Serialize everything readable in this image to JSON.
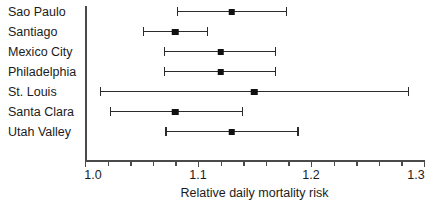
{
  "chart_data": {
    "type": "scatter",
    "title": "",
    "xlabel": "Relative daily mortality risk",
    "ylabel": "",
    "xlim": [
      1.0,
      1.3
    ],
    "grid": false,
    "legend": "none",
    "tick_labels": [
      "1.0",
      "1.1",
      "1.2",
      "1.3"
    ],
    "tick_values": [
      1.0,
      1.1,
      1.2,
      1.3
    ],
    "minor_tick_step": 0.02,
    "categories": [
      "Sao Paulo",
      "Santiago",
      "Mexico City",
      "Philadelphia",
      "St. Louis",
      "Santa Clara",
      "Utah Valley"
    ],
    "values": [
      1.13,
      1.08,
      1.12,
      1.12,
      1.15,
      1.08,
      1.13
    ],
    "ci_low": [
      1.081,
      1.051,
      1.07,
      1.07,
      1.013,
      1.022,
      1.071
    ],
    "ci_high": [
      1.179,
      1.109,
      1.169,
      1.169,
      1.287,
      1.14,
      1.189
    ],
    "points": [
      {
        "label": "Sao Paulo",
        "estimate": 1.13,
        "low": 1.081,
        "high": 1.179
      },
      {
        "label": "Santiago",
        "estimate": 1.08,
        "low": 1.051,
        "high": 1.109
      },
      {
        "label": "Mexico City",
        "estimate": 1.12,
        "low": 1.07,
        "high": 1.169
      },
      {
        "label": "Philadelphia",
        "estimate": 1.12,
        "low": 1.07,
        "high": 1.169
      },
      {
        "label": "St. Louis",
        "estimate": 1.15,
        "low": 1.013,
        "high": 1.287
      },
      {
        "label": "Santa Clara",
        "estimate": 1.08,
        "low": 1.022,
        "high": 1.14
      },
      {
        "label": "Utah Valley",
        "estimate": 1.13,
        "low": 1.071,
        "high": 1.189
      }
    ],
    "colors": {
      "marker": "#111111",
      "line": "#2b2b2b",
      "axis": "#4a4a4a",
      "text": "#1b1b1b",
      "background": "#ffffff"
    }
  }
}
